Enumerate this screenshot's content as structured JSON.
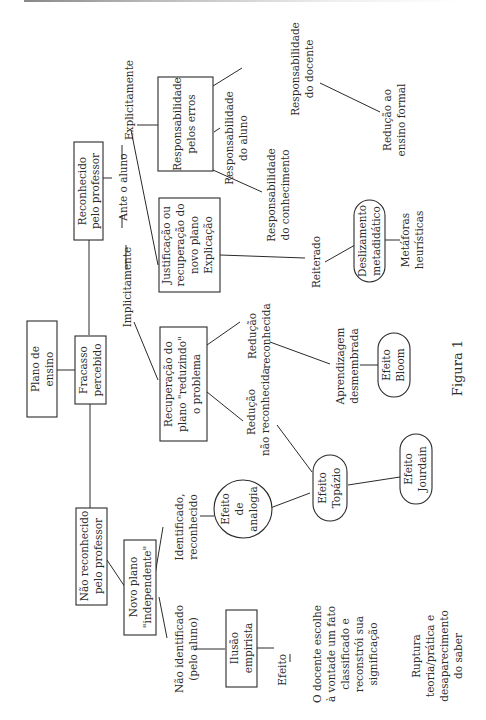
{
  "figure": {
    "caption": "Figura 1",
    "orientation": "rotated 90° counter-clockwise",
    "nodes": {
      "plano_ensino": [
        "Plano de",
        "ensino"
      ],
      "fracasso": [
        "Fracasso",
        "percebido"
      ],
      "reconhecido": [
        "Reconhecido",
        "pelo professor"
      ],
      "nao_reconhecido": [
        "Não reconhecido",
        "pelo professor"
      ],
      "ante_aluno": [
        "Ante o aluno"
      ],
      "explicitamente": [
        "Explicitamente"
      ],
      "implicitamente": [
        "Implicitamente"
      ],
      "resp_erros": [
        "Responsabilidade",
        "pelos erros"
      ],
      "resp_docente": [
        "Responsabilidade",
        "do docente"
      ],
      "resp_aluno": [
        "Responsabilidade",
        "do aluno"
      ],
      "resp_conhecimento": [
        "Responsabilidade",
        "do conhecimento"
      ],
      "reducao_formal": [
        "Redução ao",
        "ensino formal"
      ],
      "justificacao": [
        "Justificação ou",
        "recuperação do",
        "novo plano",
        "Explicação"
      ],
      "reiterado": [
        "Reiterado"
      ],
      "deslizamento": [
        "Deslizamento",
        "metadidático"
      ],
      "metaforas": [
        "Metáforas",
        "heurísticas"
      ],
      "recuperacao": [
        "Recuperação do",
        "plano \"reduzindo\"",
        "o problema"
      ],
      "reducao_reconhecida": [
        "Redução",
        "reconhecida"
      ],
      "reducao_nao_reconhecida": [
        "Redução",
        "não reconhecida"
      ],
      "aprendizagem": [
        "Aprendizagem",
        "desmembrada"
      ],
      "efeito_bloom": [
        "Efeito",
        "Bloom"
      ],
      "efeito_topazio": [
        "Efeito",
        "Topázio"
      ],
      "efeito_jourdain": [
        "Efeito",
        "Jourdain"
      ],
      "efeito_analogia": [
        "Efeito",
        "de",
        "analogia"
      ],
      "novo_plano": [
        "Novo plano",
        "\"independente\""
      ],
      "identificado": [
        "Identificado,",
        "reconhecido"
      ],
      "nao_identificado": [
        "Não identificado",
        "(pelo aluno)"
      ],
      "ilusao": [
        "Ilusão",
        "empirista"
      ],
      "efeito": [
        "Efeito"
      ],
      "docente_escolhe": [
        "O docente escolhe",
        "à vontade um fato",
        "classificado e",
        "reconstrói sua",
        "significação"
      ],
      "ruptura": [
        "Ruptura",
        "teoria/prática e",
        "desaparecimento",
        "do saber"
      ]
    }
  }
}
